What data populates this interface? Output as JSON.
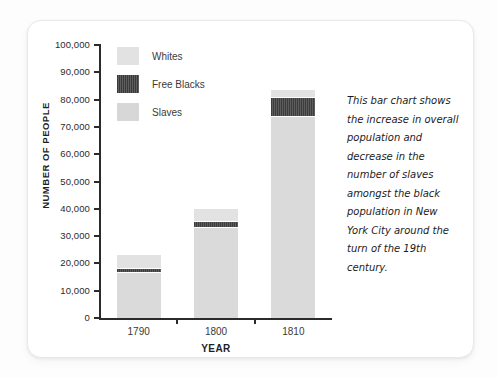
{
  "chart_data": {
    "type": "bar",
    "title": "",
    "subtype": "stacked",
    "xlabel": "YEAR",
    "ylabel": "NUMBER OF PEOPLE",
    "categories": [
      "1790",
      "1800",
      "1810"
    ],
    "ylim": [
      0,
      100000
    ],
    "ytick_values": [
      0,
      10000,
      20000,
      30000,
      40000,
      50000,
      60000,
      70000,
      80000,
      90000,
      100000
    ],
    "ytick_labels": [
      "0",
      "10,000",
      "20,000",
      "30,000",
      "40,000",
      "50,000",
      "60,000",
      "70,000",
      "80,000",
      "90,000",
      "100,000"
    ],
    "grid": false,
    "legend_position": "top-left-inside",
    "series": [
      {
        "name": "Slaves",
        "color": "#dadada",
        "values": [
          16500,
          33000,
          73500
        ]
      },
      {
        "name": "Free Blacks",
        "color": "#4a4a4a",
        "values": [
          2000,
          2500,
          7500
        ]
      },
      {
        "name": "Whites",
        "color": "#e2e2e2",
        "values": [
          4500,
          4500,
          2500
        ]
      }
    ],
    "totals": [
      23000,
      40000,
      83500
    ],
    "annotation": "This bar chart shows the increase in overall population and decrease in the number of slaves amongst the black population in New York City around the turn of the 19th century."
  },
  "legend": {
    "items": [
      {
        "label": "Whites"
      },
      {
        "label": "Free Blacks"
      },
      {
        "label": "Slaves"
      }
    ]
  }
}
